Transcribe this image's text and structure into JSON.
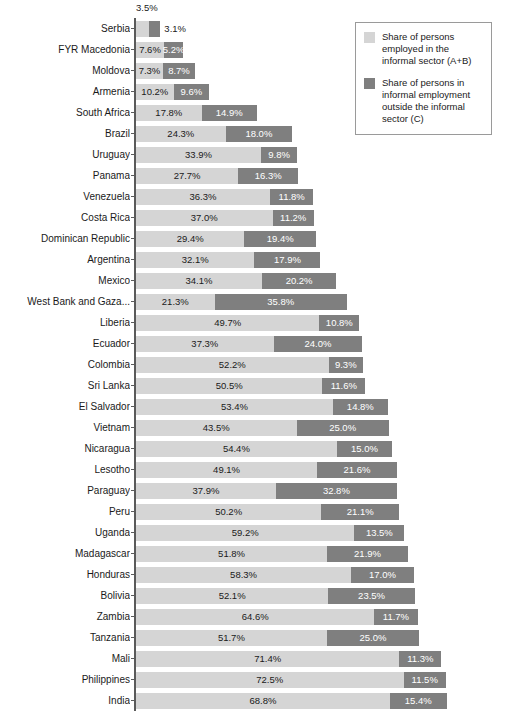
{
  "legend": {
    "items": [
      {
        "swatch_color": "#d5d5d5",
        "label": "Share of persons employed in the informal sector (A+B)",
        "series_key": "A+B"
      },
      {
        "swatch_color": "#7f7f7f",
        "label": "Share of persons in informal employment outside the informal sector (C)",
        "series_key": "C"
      }
    ]
  },
  "axis": {
    "first_bar_callout": "3.5%",
    "px_per_percent": 3.69,
    "origin_x_px": 136
  },
  "chart_data": {
    "type": "bar",
    "orientation": "horizontal",
    "stacked": true,
    "title": "",
    "subtitle": "",
    "xlabel": "",
    "ylabel": "",
    "grid": false,
    "legend_position": "top-right",
    "xlim": [
      0,
      84.2
    ],
    "value_suffix": "%",
    "series": [
      {
        "name": "Share of persons employed in the informal sector (A+B)",
        "key": "A+B",
        "color": "#d5d5d5",
        "values": [
          3.5,
          7.6,
          7.3,
          10.2,
          17.8,
          24.3,
          33.9,
          27.7,
          36.3,
          37.0,
          29.4,
          32.1,
          34.1,
          21.3,
          49.7,
          37.3,
          52.2,
          50.5,
          53.4,
          43.5,
          54.4,
          49.1,
          37.9,
          50.2,
          59.2,
          51.8,
          58.3,
          52.1,
          64.6,
          51.7,
          71.4,
          72.5,
          68.8
        ]
      },
      {
        "name": "Share of persons in informal employment outside the informal sector (C)",
        "key": "C",
        "color": "#7f7f7f",
        "values": [
          3.1,
          5.2,
          8.7,
          9.6,
          14.9,
          18.0,
          9.8,
          16.3,
          11.8,
          11.2,
          19.4,
          17.9,
          20.2,
          35.8,
          10.8,
          24.0,
          9.3,
          11.6,
          14.8,
          25.0,
          15.0,
          21.6,
          32.8,
          21.1,
          13.5,
          21.9,
          17.0,
          23.5,
          11.7,
          25.0,
          11.3,
          11.5,
          15.4
        ]
      }
    ],
    "categories": [
      "Serbia",
      "FYR Macedonia",
      "Moldova",
      "Armenia",
      "South Africa",
      "Brazil",
      "Uruguay",
      "Panama",
      "Venezuela",
      "Costa Rica",
      "Dominican Republic",
      "Argentina",
      "Mexico",
      "West Bank and Gaza...",
      "Liberia",
      "Ecuador",
      "Colombia",
      "Sri Lanka",
      "El Salvador",
      "Vietnam",
      "Nicaragua",
      "Lesotho",
      "Paraguay",
      "Peru",
      "Uganda",
      "Madagascar",
      "Honduras",
      "Bolivia",
      "Zambia",
      "Tanzania",
      "Mali",
      "Philippines",
      "India"
    ],
    "rows": [
      {
        "category": "Serbia",
        "a_label": "3.5%",
        "c_label": "3.1%",
        "a": 3.5,
        "c": 3.1,
        "a_label_outside": true,
        "c_label_outside": true
      },
      {
        "category": "FYR Macedonia",
        "a_label": "7.6%",
        "c_label": "5.2%",
        "a": 7.6,
        "c": 5.2,
        "a_label_outside": false,
        "c_label_outside": false
      },
      {
        "category": "Moldova",
        "a_label": "7.3%",
        "c_label": "8.7%",
        "a": 7.3,
        "c": 8.7,
        "a_label_outside": false,
        "c_label_outside": false
      },
      {
        "category": "Armenia",
        "a_label": "10.2%",
        "c_label": "9.6%",
        "a": 10.2,
        "c": 9.6,
        "a_label_outside": false,
        "c_label_outside": false
      },
      {
        "category": "South Africa",
        "a_label": "17.8%",
        "c_label": "14.9%",
        "a": 17.8,
        "c": 14.9,
        "a_label_outside": false,
        "c_label_outside": false
      },
      {
        "category": "Brazil",
        "a_label": "24.3%",
        "c_label": "18.0%",
        "a": 24.3,
        "c": 18.0,
        "a_label_outside": false,
        "c_label_outside": false
      },
      {
        "category": "Uruguay",
        "a_label": "33.9%",
        "c_label": "9.8%",
        "a": 33.9,
        "c": 9.8,
        "a_label_outside": false,
        "c_label_outside": false
      },
      {
        "category": "Panama",
        "a_label": "27.7%",
        "c_label": "16.3%",
        "a": 27.7,
        "c": 16.3,
        "a_label_outside": false,
        "c_label_outside": false
      },
      {
        "category": "Venezuela",
        "a_label": "36.3%",
        "c_label": "11.8%",
        "a": 36.3,
        "c": 11.8,
        "a_label_outside": false,
        "c_label_outside": false
      },
      {
        "category": "Costa Rica",
        "a_label": "37.0%",
        "c_label": "11.2%",
        "a": 37.0,
        "c": 11.2,
        "a_label_outside": false,
        "c_label_outside": false
      },
      {
        "category": "Dominican Republic",
        "a_label": "29.4%",
        "c_label": "19.4%",
        "a": 29.4,
        "c": 19.4,
        "a_label_outside": false,
        "c_label_outside": false
      },
      {
        "category": "Argentina",
        "a_label": "32.1%",
        "c_label": "17.9%",
        "a": 32.1,
        "c": 17.9,
        "a_label_outside": false,
        "c_label_outside": false
      },
      {
        "category": "Mexico",
        "a_label": "34.1%",
        "c_label": "20.2%",
        "a": 34.1,
        "c": 20.2,
        "a_label_outside": false,
        "c_label_outside": false
      },
      {
        "category": "West Bank and Gaza...",
        "a_label": "21.3%",
        "c_label": "35.8%",
        "a": 21.3,
        "c": 35.8,
        "a_label_outside": false,
        "c_label_outside": false
      },
      {
        "category": "Liberia",
        "a_label": "49.7%",
        "c_label": "10.8%",
        "a": 49.7,
        "c": 10.8,
        "a_label_outside": false,
        "c_label_outside": false
      },
      {
        "category": "Ecuador",
        "a_label": "37.3%",
        "c_label": "24.0%",
        "a": 37.3,
        "c": 24.0,
        "a_label_outside": false,
        "c_label_outside": false
      },
      {
        "category": "Colombia",
        "a_label": "52.2%",
        "c_label": "9.3%",
        "a": 52.2,
        "c": 9.3,
        "a_label_outside": false,
        "c_label_outside": false
      },
      {
        "category": "Sri Lanka",
        "a_label": "50.5%",
        "c_label": "11.6%",
        "a": 50.5,
        "c": 11.6,
        "a_label_outside": false,
        "c_label_outside": false
      },
      {
        "category": "El Salvador",
        "a_label": "53.4%",
        "c_label": "14.8%",
        "a": 53.4,
        "c": 14.8,
        "a_label_outside": false,
        "c_label_outside": false
      },
      {
        "category": "Vietnam",
        "a_label": "43.5%",
        "c_label": "25.0%",
        "a": 43.5,
        "c": 25.0,
        "a_label_outside": false,
        "c_label_outside": false
      },
      {
        "category": "Nicaragua",
        "a_label": "54.4%",
        "c_label": "15.0%",
        "a": 54.4,
        "c": 15.0,
        "a_label_outside": false,
        "c_label_outside": false
      },
      {
        "category": "Lesotho",
        "a_label": "49.1%",
        "c_label": "21.6%",
        "a": 49.1,
        "c": 21.6,
        "a_label_outside": false,
        "c_label_outside": false
      },
      {
        "category": "Paraguay",
        "a_label": "37.9%",
        "c_label": "32.8%",
        "a": 37.9,
        "c": 32.8,
        "a_label_outside": false,
        "c_label_outside": false
      },
      {
        "category": "Peru",
        "a_label": "50.2%",
        "c_label": "21.1%",
        "a": 50.2,
        "c": 21.1,
        "a_label_outside": false,
        "c_label_outside": false
      },
      {
        "category": "Uganda",
        "a_label": "59.2%",
        "c_label": "13.5%",
        "a": 59.2,
        "c": 13.5,
        "a_label_outside": false,
        "c_label_outside": false
      },
      {
        "category": "Madagascar",
        "a_label": "51.8%",
        "c_label": "21.9%",
        "a": 51.8,
        "c": 21.9,
        "a_label_outside": false,
        "c_label_outside": false
      },
      {
        "category": "Honduras",
        "a_label": "58.3%",
        "c_label": "17.0%",
        "a": 58.3,
        "c": 17.0,
        "a_label_outside": false,
        "c_label_outside": false
      },
      {
        "category": "Bolivia",
        "a_label": "52.1%",
        "c_label": "23.5%",
        "a": 52.1,
        "c": 23.5,
        "a_label_outside": false,
        "c_label_outside": false
      },
      {
        "category": "Zambia",
        "a_label": "64.6%",
        "c_label": "11.7%",
        "a": 64.6,
        "c": 11.7,
        "a_label_outside": false,
        "c_label_outside": false
      },
      {
        "category": "Tanzania",
        "a_label": "51.7%",
        "c_label": "25.0%",
        "a": 51.7,
        "c": 25.0,
        "a_label_outside": false,
        "c_label_outside": false
      },
      {
        "category": "Mali",
        "a_label": "71.4%",
        "c_label": "11.3%",
        "a": 71.4,
        "c": 11.3,
        "a_label_outside": false,
        "c_label_outside": false
      },
      {
        "category": "Philippines",
        "a_label": "72.5%",
        "c_label": "11.5%",
        "a": 72.5,
        "c": 11.5,
        "a_label_outside": false,
        "c_label_outside": false
      },
      {
        "category": "India",
        "a_label": "68.8%",
        "c_label": "15.4%",
        "a": 68.8,
        "c": 15.4,
        "a_label_outside": false,
        "c_label_outside": false
      }
    ]
  }
}
